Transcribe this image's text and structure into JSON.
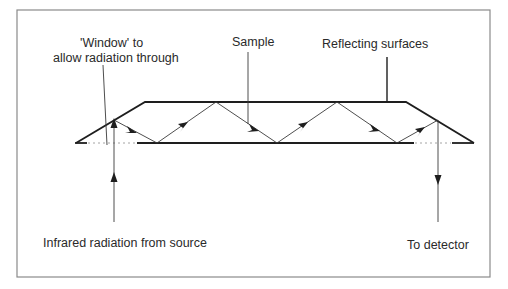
{
  "diagram": {
    "type": "ATR crystal infrared beam path",
    "labels": {
      "window": [
        "'Window' to",
        "allow radiation through"
      ],
      "sample": "Sample",
      "reflecting_surfaces": "Reflecting surfaces",
      "source": "Infrared radiation from source",
      "detector": "To detector"
    },
    "colors": {
      "line": "#1e1e1e",
      "frame": "#8a8a8a",
      "background": "#ffffff"
    }
  }
}
